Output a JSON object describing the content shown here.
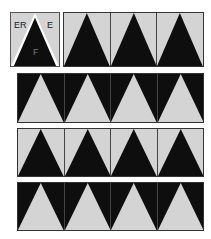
{
  "colors": {
    "light": "#d4d4d4",
    "dark": "#0e0e0e",
    "outline": "#ffffff"
  },
  "legend_tile": {
    "labels": {
      "top_left": "ER",
      "top_right": "E",
      "center": "F"
    }
  },
  "rows": [
    {
      "id": "row-1",
      "triangles": 3,
      "triangle_color": "dark",
      "background_color": "light"
    },
    {
      "id": "row-2",
      "triangles": 4,
      "triangle_color": "light",
      "background_color": "dark"
    },
    {
      "id": "row-3",
      "triangles": 4,
      "triangle_color": "dark",
      "background_color": "light"
    },
    {
      "id": "row-4",
      "triangles": 4,
      "triangle_color": "light",
      "background_color": "dark"
    }
  ]
}
